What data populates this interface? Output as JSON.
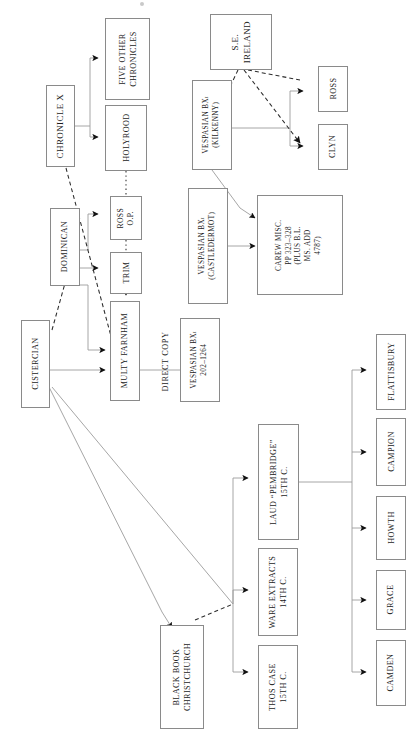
{
  "diagram": {
    "type": "stemma-flow-diagram",
    "orientation": "text rotated 90 degrees counter-clockwise",
    "colors": {
      "box_border": "#8a8a8a",
      "solid_edge": "#9a9a9a",
      "dashed_edge": "#2a2a2a",
      "arrowhead": "#111111",
      "text": "#1b1b1b",
      "background": "#ffffff"
    },
    "nodes": [
      {
        "id": "chronicle_x",
        "lines": [
          "CHRONICLE X"
        ]
      },
      {
        "id": "five_other",
        "lines": [
          "FIVE OTHER",
          "CHRONICLES"
        ]
      },
      {
        "id": "holyrood",
        "lines": [
          "HOLYROOD"
        ]
      },
      {
        "id": "se_ireland",
        "lines": [
          "S.E.",
          "IRELAND"
        ]
      },
      {
        "id": "vesp_kilkenny",
        "lines": [
          "VESPASIAN BXi",
          "(KILKENNY)"
        ]
      },
      {
        "id": "ross_box",
        "lines": [
          "ROSS"
        ]
      },
      {
        "id": "clyn",
        "lines": [
          "CLYN"
        ]
      },
      {
        "id": "ross_op",
        "lines": [
          "ROSS",
          "O.P."
        ]
      },
      {
        "id": "trim",
        "lines": [
          "TRIM"
        ]
      },
      {
        "id": "dominican",
        "lines": [
          "DOMINICAN"
        ]
      },
      {
        "id": "cistercian",
        "lines": [
          "CISTERCIAN"
        ]
      },
      {
        "id": "multy_farnham",
        "lines": [
          "MULTY FARNHAM"
        ]
      },
      {
        "id": "vesp_castledermot",
        "lines": [
          "VESPASIAN BXi",
          "(CASTLEDERMOT)"
        ]
      },
      {
        "id": "carew_misc",
        "lines": [
          "CAREW MISC.",
          "PP 323–328",
          "(PLUS B.L.",
          "MS. ADD",
          "4787)"
        ]
      },
      {
        "id": "vesp_202",
        "lines": [
          "VESPASIAN BXi",
          "202–1264"
        ]
      },
      {
        "id": "black_book",
        "lines": [
          "BLACK BOOK",
          "CHRISTCHURCH"
        ]
      },
      {
        "id": "thos_case",
        "lines": [
          "THOS CASE",
          "15TH C."
        ]
      },
      {
        "id": "ware_extracts",
        "lines": [
          "WARE EXTRACTS",
          "14TH C."
        ]
      },
      {
        "id": "laud_pembridge",
        "lines": [
          "LAUD “PEMBRIDGE”",
          "15TH C."
        ]
      },
      {
        "id": "flattisbury",
        "lines": [
          "FLATTISBURY"
        ]
      },
      {
        "id": "campion",
        "lines": [
          "CAMPION"
        ]
      },
      {
        "id": "howth",
        "lines": [
          "HOWTH"
        ]
      },
      {
        "id": "grace",
        "lines": [
          "GRACE"
        ]
      },
      {
        "id": "camden",
        "lines": [
          "CAMDEN"
        ]
      }
    ],
    "free_labels": [
      {
        "id": "direct_copy",
        "text": "DIRECT COPY"
      }
    ],
    "edges": [
      {
        "from": "chronicle_x",
        "to": "five_other",
        "style": "solid"
      },
      {
        "from": "chronicle_x",
        "to": "holyrood",
        "style": "solid"
      },
      {
        "from": "chronicle_x",
        "to": "multy_farnham",
        "style": "dashed"
      },
      {
        "from": "holyrood",
        "to": "ross_op",
        "style": "dotted"
      },
      {
        "from": "se_ireland",
        "to": "ross_box",
        "style": "dashed"
      },
      {
        "from": "se_ireland",
        "to": "clyn",
        "style": "dashed"
      },
      {
        "from": "se_ireland",
        "to": "vesp_kilkenny",
        "style": "dashed"
      },
      {
        "from": "vesp_kilkenny",
        "to": "ross_box",
        "style": "solid"
      },
      {
        "from": "vesp_kilkenny",
        "to": "clyn",
        "style": "solid"
      },
      {
        "from": "vesp_kilkenny",
        "to": "carew_misc",
        "style": "solid"
      },
      {
        "from": "dominican",
        "to": "ross_op",
        "style": "solid"
      },
      {
        "from": "dominican",
        "to": "trim",
        "style": "solid"
      },
      {
        "from": "dominican",
        "to": "multy_farnham",
        "style": "solid"
      },
      {
        "from": "ross_op",
        "to": "trim",
        "style": "dotted"
      },
      {
        "from": "trim",
        "to": "multy_farnham",
        "style": "solid"
      },
      {
        "from": "cistercian",
        "to": "multy_farnham",
        "style": "solid"
      },
      {
        "from": "cistercian",
        "to": "dominican",
        "style": "dashed"
      },
      {
        "from": "cistercian",
        "to": "black_book",
        "style": "solid"
      },
      {
        "from": "multy_farnham",
        "to": "vesp_202",
        "style": "solid"
      },
      {
        "from": "vesp_castledermot",
        "to": "carew_misc",
        "style": "solid"
      },
      {
        "from": "black_book",
        "to": "thos_case",
        "style": "solid"
      },
      {
        "from": "black_book",
        "to": "ware_extracts",
        "style": "solid"
      },
      {
        "from": "black_book",
        "to": "laud_pembridge",
        "style": "dashed"
      },
      {
        "from": "laud_pembridge",
        "to": "flattisbury",
        "style": "solid"
      },
      {
        "from": "laud_pembridge",
        "to": "campion",
        "style": "solid"
      },
      {
        "from": "laud_pembridge",
        "to": "howth",
        "style": "solid"
      },
      {
        "from": "laud_pembridge",
        "to": "grace",
        "style": "solid"
      },
      {
        "from": "laud_pembridge",
        "to": "camden",
        "style": "solid"
      }
    ]
  }
}
